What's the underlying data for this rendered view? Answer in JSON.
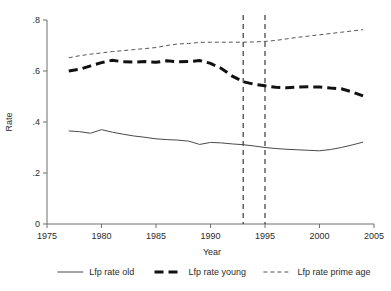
{
  "chart_data": {
    "type": "line",
    "title": "",
    "xlabel": "Year",
    "ylabel": "Rate",
    "xlim": [
      1975,
      2005
    ],
    "ylim": [
      0,
      0.8
    ],
    "xticks": [
      1975,
      1980,
      1985,
      1990,
      1995,
      2000,
      2005
    ],
    "xtick_labels": [
      "1975",
      "1980",
      "1985",
      "1990",
      "1995",
      "2000",
      "2005"
    ],
    "yticks": [
      0,
      0.2,
      0.4,
      0.6,
      0.8
    ],
    "ytick_labels": [
      "0",
      ".2",
      ".4",
      ".6",
      ".8"
    ],
    "grid": false,
    "legend_position": "bottom",
    "x": [
      1977,
      1978,
      1979,
      1980,
      1981,
      1982,
      1983,
      1984,
      1985,
      1986,
      1987,
      1988,
      1989,
      1990,
      1991,
      1992,
      1993,
      1994,
      1995,
      1996,
      1997,
      1998,
      1999,
      2000,
      2001,
      2002,
      2003,
      2004
    ],
    "series": [
      {
        "name": "Lfp rate old",
        "style": "solid",
        "values": [
          0.365,
          0.362,
          0.356,
          0.37,
          0.36,
          0.352,
          0.345,
          0.34,
          0.334,
          0.331,
          0.329,
          0.325,
          0.312,
          0.32,
          0.318,
          0.314,
          0.311,
          0.306,
          0.3,
          0.296,
          0.293,
          0.291,
          0.289,
          0.287,
          0.292,
          0.3,
          0.31,
          0.321
        ]
      },
      {
        "name": "Lfp rate young",
        "style": "dashed-thick",
        "values": [
          0.6,
          0.607,
          0.62,
          0.633,
          0.642,
          0.636,
          0.635,
          0.637,
          0.634,
          0.64,
          0.636,
          0.637,
          0.641,
          0.63,
          0.61,
          0.58,
          0.558,
          0.548,
          0.542,
          0.536,
          0.534,
          0.537,
          0.538,
          0.537,
          0.533,
          0.53,
          0.518,
          0.502
        ]
      },
      {
        "name": "Lfp rate prime age",
        "style": "dashed-thin",
        "values": [
          0.652,
          0.66,
          0.666,
          0.671,
          0.676,
          0.68,
          0.684,
          0.688,
          0.692,
          0.7,
          0.706,
          0.708,
          0.712,
          0.713,
          0.713,
          0.713,
          0.713,
          0.714,
          0.716,
          0.72,
          0.726,
          0.732,
          0.737,
          0.742,
          0.747,
          0.752,
          0.757,
          0.762
        ]
      }
    ],
    "annotations": [
      {
        "name": "vertical-line-1993",
        "type": "vline",
        "x": 1993,
        "style": "dashed"
      },
      {
        "name": "vertical-line-1995",
        "type": "vline",
        "x": 1995,
        "style": "dashed"
      }
    ],
    "colors": {
      "old": "#4a4a4a",
      "young": "#111111",
      "prime": "#555555",
      "axis": "#6f6f6f",
      "annotation": "#3a3a3a",
      "background": "#ffffff"
    }
  },
  "legend": {
    "items": [
      {
        "label": "Lfp rate old",
        "style": "solid"
      },
      {
        "label": "Lfp rate young",
        "style": "dashed-thick"
      },
      {
        "label": "Lfp rate prime age",
        "style": "dashed-thin"
      }
    ]
  }
}
